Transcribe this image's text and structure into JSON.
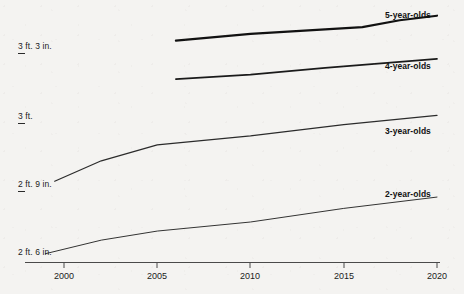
{
  "chart_data": {
    "type": "line",
    "title": "",
    "subtitle": "",
    "xlabel": "",
    "ylabel": "",
    "xlim": [
      1998.5,
      2020.5
    ],
    "ylim_inches": [
      29.2,
      40.5
    ],
    "grid": false,
    "legend_position": "line-end-labels",
    "x_ticks": [
      "2000",
      "2005",
      "2010",
      "2015",
      "2020"
    ],
    "x_tick_values": [
      2000,
      2005,
      2010,
      2015,
      2020
    ],
    "y_ticks": [
      "2 ft. 6 in.",
      "2 ft. 9 in.",
      "3 ft.",
      "3 ft. 3 in."
    ],
    "y_tick_values_inches": [
      30,
      33,
      36,
      39
    ],
    "series": [
      {
        "name": "5-year-olds",
        "label": "5-year-olds",
        "color": "#111111",
        "stroke_width": 2.2,
        "x": [
          2006,
          2010,
          2014,
          2016,
          2018,
          2020
        ],
        "values_inches": [
          39.5,
          39.8,
          40.0,
          40.1,
          40.4,
          40.6
        ]
      },
      {
        "name": "4-year-olds",
        "label": "4-year-olds",
        "color": "#1a1a1a",
        "stroke_width": 1.7,
        "x": [
          2006,
          2010,
          2014,
          2017,
          2020
        ],
        "values_inches": [
          37.8,
          38.0,
          38.3,
          38.5,
          38.7
        ]
      },
      {
        "name": "3-year-olds",
        "label": "3-year-olds",
        "color": "#2b2b2b",
        "stroke_width": 1.2,
        "x": [
          1999.5,
          2002,
          2005,
          2010,
          2015,
          2020
        ],
        "values_inches": [
          33.3,
          34.2,
          34.9,
          35.3,
          35.8,
          36.2
        ]
      },
      {
        "name": "2-year-olds",
        "label": "2-year-olds",
        "color": "#333333",
        "stroke_width": 1.0,
        "x": [
          1999,
          2002,
          2005,
          2010,
          2015,
          2020
        ],
        "values_inches": [
          30.1,
          30.7,
          31.1,
          31.5,
          32.1,
          32.6
        ]
      }
    ]
  },
  "axis": {
    "x_axis_label_2000": "2000",
    "x_axis_label_2005": "2005",
    "x_axis_label_2010": "2010",
    "x_axis_label_2015": "2015",
    "x_axis_label_2020": "2020",
    "y_axis_label_39": "3 ft. 3 in.",
    "y_axis_label_36": "3 ft.",
    "y_axis_label_33": "2 ft. 9 in.",
    "y_axis_label_30": "2 ft. 6 in."
  },
  "series_labels": {
    "five": "5-year-olds",
    "four": "4-year-olds",
    "three": "3-year-olds",
    "two": "2-year-olds"
  },
  "colors": {
    "background": "#f4f3f1",
    "ink": "#111111",
    "axis": "#3a3a3a"
  }
}
